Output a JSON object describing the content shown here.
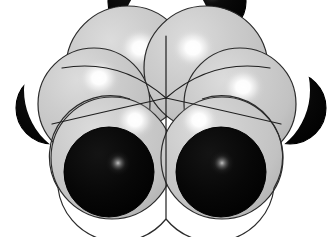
{
  "figure": {
    "kind": "space-filling-molecular-model",
    "title": "",
    "caption": "",
    "canvas": {
      "width": 332,
      "height": 237,
      "background": "#ffffff"
    }
  },
  "palette": {
    "background": "#ffffff",
    "sphere_gray_base": "#c8c8c8",
    "sphere_gray_light": "#e2e2e2",
    "sphere_gray_shadow": "#a8a8a8",
    "sphere_gray_highlight": "#ffffff",
    "sphere_black_base": "#0a0a0a",
    "sphere_black_shadow": "#000000",
    "sphere_black_highlight": "#8a8a8a",
    "outline": "#2b2b2b",
    "seam_line": "#1f1f1f"
  },
  "render": {
    "outline_width_px": 1.2,
    "seam_width_px": 1.2,
    "light_direction": "upper-left",
    "projection": "orthographic-front"
  },
  "atoms": [
    {
      "id": "black-rear-left",
      "element_color": "black",
      "label": "rear left dark sphere",
      "cx": 140,
      "cy": 2,
      "r": 32,
      "highlight_cx": 138,
      "highlight_cy": -6,
      "highlight_r": 12,
      "z": 0
    },
    {
      "id": "black-rear-right",
      "element_color": "black",
      "label": "rear right dark sphere",
      "cx": 214,
      "cy": 2,
      "r": 32,
      "highlight_cx": 212,
      "highlight_cy": -6,
      "highlight_r": 12,
      "z": 0
    },
    {
      "id": "black-left",
      "element_color": "black",
      "label": "left dark sphere",
      "cx": 52,
      "cy": 108,
      "r": 36,
      "highlight_cx": 40,
      "highlight_cy": 96,
      "highlight_r": 13,
      "z": 1
    },
    {
      "id": "black-right",
      "element_color": "black",
      "label": "right dark sphere",
      "cx": 290,
      "cy": 108,
      "r": 36,
      "highlight_cx": 288,
      "highlight_cy": 100,
      "highlight_r": 13,
      "z": 1
    },
    {
      "id": "gray-top-left",
      "element_color": "gray",
      "label": "upper left light sphere",
      "cx": 128,
      "cy": 68,
      "r": 62,
      "highlight_cx": 140,
      "highlight_cy": 48,
      "highlight_r": 22,
      "z": 2
    },
    {
      "id": "gray-top-right",
      "element_color": "gray",
      "label": "upper right light sphere",
      "cx": 206,
      "cy": 68,
      "r": 62,
      "highlight_cx": 193,
      "highlight_cy": 48,
      "highlight_r": 22,
      "z": 2
    },
    {
      "id": "gray-mid-left",
      "element_color": "gray",
      "label": "middle left light sphere",
      "cx": 94,
      "cy": 104,
      "r": 56,
      "highlight_cx": 99,
      "highlight_cy": 78,
      "highlight_r": 21,
      "z": 3
    },
    {
      "id": "gray-mid-right",
      "element_color": "gray",
      "label": "middle right light sphere",
      "cx": 240,
      "cy": 104,
      "r": 56,
      "highlight_cx": 243,
      "highlight_cy": 87,
      "highlight_r": 21,
      "z": 3
    },
    {
      "id": "gray-front-left",
      "element_color": "gray",
      "label": "front left light sphere",
      "cx": 112,
      "cy": 158,
      "r": 61,
      "highlight_cx": 135,
      "highlight_cy": 120,
      "highlight_r": 21,
      "z": 4
    },
    {
      "id": "gray-front-right",
      "element_color": "gray",
      "label": "front right light sphere",
      "cx": 222,
      "cy": 158,
      "r": 61,
      "highlight_cx": 199,
      "highlight_cy": 120,
      "highlight_r": 21,
      "z": 4
    },
    {
      "id": "black-front-left",
      "element_color": "black",
      "label": "front left dark sphere",
      "cx": 109,
      "cy": 172,
      "r": 45,
      "highlight_cx": 118,
      "highlight_cy": 163,
      "highlight_r": 14,
      "z": 5
    },
    {
      "id": "black-front-right",
      "element_color": "black",
      "label": "front right dark sphere",
      "cx": 221,
      "cy": 172,
      "r": 45,
      "highlight_cx": 222,
      "highlight_cy": 163,
      "highlight_r": 14,
      "z": 5
    }
  ],
  "geometry": {
    "symmetry": "bilateral-mirror-about-vertical-axis",
    "mirror_axis_x": 166,
    "seam_convergence_point": {
      "x": 166,
      "y": 98
    },
    "vertical_seam": {
      "x": 166,
      "y_top": 36,
      "y_bottom": 218
    },
    "gray_sphere_count": 6,
    "black_sphere_count": 6,
    "total_sphere_count": 12
  },
  "counts": {
    "gray_spheres": "6",
    "black_spheres": "6",
    "total": "12"
  }
}
